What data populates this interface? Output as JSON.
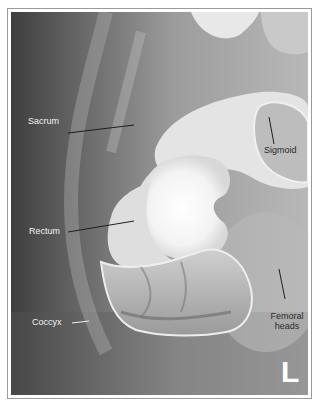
{
  "figure": {
    "type": "barium-enema-radiograph",
    "colors": {
      "background": "#6e6e6e",
      "barium": "#ffffff",
      "label_light": "#f2f2f2",
      "label_dark": "#2a2a2a",
      "leader_line": "#1e1e1e",
      "frame": "#9a9a9a"
    },
    "labels": [
      {
        "id": "sacrum",
        "text": "Sacrum"
      },
      {
        "id": "sigmoid",
        "text": "Sigmoid"
      },
      {
        "id": "rectum",
        "text": "Rectum"
      },
      {
        "id": "coccyx",
        "text": "Coccyx"
      },
      {
        "id": "femoral_heads",
        "text": "Femoral heads",
        "line1": "Femoral",
        "line2": "heads"
      }
    ],
    "side_marker": "L"
  }
}
